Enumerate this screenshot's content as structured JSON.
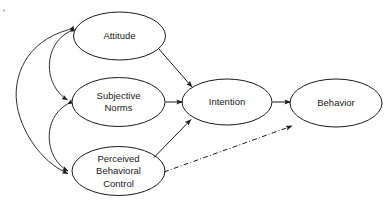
{
  "diagram": {
    "background_color": "#ffffff",
    "stroke_color": "#1a1a1a",
    "nodes": [
      {
        "id": "attitude",
        "label": "Attitude",
        "lines": [
          "Attitude"
        ],
        "cx": 119.5,
        "cy": 36,
        "rx": 46,
        "ry": 24
      },
      {
        "id": "subjective-norms",
        "label": "Subjective Norms",
        "lines": [
          "Subjective",
          "Norms"
        ],
        "cx": 118.5,
        "cy": 102,
        "rx": 46.5,
        "ry": 24.5
      },
      {
        "id": "perceived-behavioral-control",
        "label": "Perceived Behavioral Control",
        "lines": [
          "Perceived",
          "Behavioral",
          "Control"
        ],
        "cx": 118.5,
        "cy": 171,
        "rx": 46.5,
        "ry": 24.5
      },
      {
        "id": "intention",
        "label": "Intention",
        "lines": [
          "Intention"
        ],
        "cx": 227,
        "cy": 102,
        "rx": 45,
        "ry": 23
      },
      {
        "id": "behavior",
        "label": "Behavior",
        "lines": [
          "Behavior"
        ],
        "cx": 336,
        "cy": 103,
        "rx": 46,
        "ry": 24
      }
    ],
    "edges": [
      {
        "id": "attitude-to-intention",
        "from": "attitude",
        "to": "intention",
        "style": "solid",
        "arrow": "single"
      },
      {
        "id": "subjective-norms-to-intention",
        "from": "subjective-norms",
        "to": "intention",
        "style": "solid",
        "arrow": "single"
      },
      {
        "id": "perceived-behavioral-control-to-intention",
        "from": "perceived-behavioral-control",
        "to": "intention",
        "style": "solid",
        "arrow": "single"
      },
      {
        "id": "intention-to-behavior",
        "from": "intention",
        "to": "behavior",
        "style": "solid",
        "arrow": "single"
      },
      {
        "id": "perceived-behavioral-control-to-behavior",
        "from": "perceived-behavioral-control",
        "to": "behavior",
        "style": "dash-dot",
        "arrow": "single"
      },
      {
        "id": "attitude-subjective-norms-correlation",
        "from": "attitude",
        "to": "subjective-norms",
        "style": "curved",
        "arrow": "double"
      },
      {
        "id": "subjective-norms-perceived-behavioral-control-correlation",
        "from": "subjective-norms",
        "to": "perceived-behavioral-control",
        "style": "curved",
        "arrow": "double"
      },
      {
        "id": "attitude-perceived-behavioral-control-correlation",
        "from": "attitude",
        "to": "perceived-behavioral-control",
        "style": "curved",
        "arrow": "double"
      }
    ]
  }
}
